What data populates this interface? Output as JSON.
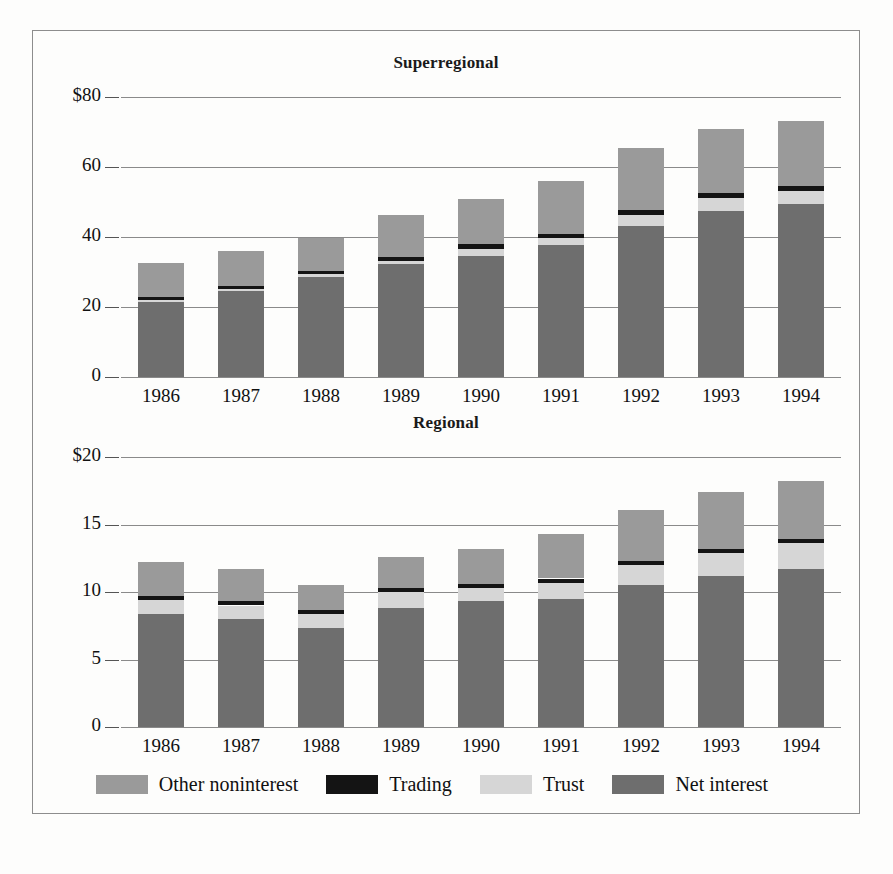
{
  "figure": {
    "background": "#fdfdfc",
    "frame_color": "#8d8d8d"
  },
  "colors": {
    "other_noninterest": "#9a9a9a",
    "trading": "#141414",
    "trust": "#d6d6d6",
    "net_interest": "#6e6e6e",
    "gridline": "#8a8a8a",
    "text": "#111111"
  },
  "legend": {
    "position": "bottom",
    "items": [
      {
        "label": "Other noninterest",
        "color_key": "other_noninterest",
        "swatch": "#9a9a9a"
      },
      {
        "label": "Trading",
        "color_key": "trading",
        "swatch": "#141414"
      },
      {
        "label": "Trust",
        "color_key": "trust",
        "swatch": "#d6d6d6"
      },
      {
        "label": "Net interest",
        "color_key": "net_interest",
        "swatch": "#6e6e6e"
      }
    ]
  },
  "chart_data": [
    {
      "type": "bar",
      "stacked": true,
      "title": "Superregional",
      "xlabel": "",
      "ylabel": "",
      "ylim": [
        0,
        80
      ],
      "yticks": [
        0,
        20,
        40,
        60,
        80
      ],
      "ytick_labels": [
        "0",
        "20",
        "40",
        "60",
        "$80"
      ],
      "grid": true,
      "categories": [
        "1986",
        "1987",
        "1988",
        "1989",
        "1990",
        "1991",
        "1992",
        "1993",
        "1994"
      ],
      "series": [
        {
          "name": "Net interest",
          "values": [
            21.5,
            24.5,
            28.6,
            32.3,
            34.6,
            37.6,
            43.2,
            47.4,
            49.3
          ]
        },
        {
          "name": "Trust",
          "values": [
            0.5,
            0.6,
            0.7,
            0.9,
            2.1,
            2.0,
            3.1,
            3.8,
            3.9
          ]
        },
        {
          "name": "Trading",
          "values": [
            0.9,
            1.0,
            1.0,
            1.1,
            1.2,
            1.3,
            1.3,
            1.3,
            1.4
          ]
        },
        {
          "name": "Other noninterest",
          "values": [
            9.6,
            10.0,
            9.3,
            12.0,
            13.0,
            15.1,
            17.7,
            18.5,
            18.5
          ]
        }
      ],
      "totals": [
        32.5,
        36.1,
        39.6,
        46.3,
        50.9,
        56.0,
        65.3,
        71.0,
        73.1
      ]
    },
    {
      "type": "bar",
      "stacked": true,
      "title": "Regional",
      "xlabel": "",
      "ylabel": "",
      "ylim": [
        0,
        20
      ],
      "yticks": [
        0,
        5,
        10,
        15,
        20
      ],
      "ytick_labels": [
        "0",
        "5",
        "10",
        "15",
        "$20"
      ],
      "grid": true,
      "categories": [
        "1986",
        "1987",
        "1988",
        "1989",
        "1990",
        "1991",
        "1992",
        "1993",
        "1994"
      ],
      "series": [
        {
          "name": "Net interest",
          "values": [
            8.4,
            8.0,
            7.3,
            8.8,
            9.3,
            9.5,
            10.5,
            11.2,
            11.7
          ]
        },
        {
          "name": "Trust",
          "values": [
            1.0,
            1.0,
            1.1,
            1.2,
            1.0,
            1.2,
            1.5,
            1.7,
            1.9
          ]
        },
        {
          "name": "Trading",
          "values": [
            0.3,
            0.3,
            0.3,
            0.3,
            0.3,
            0.3,
            0.3,
            0.3,
            0.3
          ]
        },
        {
          "name": "Other noninterest",
          "values": [
            2.5,
            2.4,
            1.8,
            2.3,
            2.6,
            3.3,
            3.8,
            4.2,
            4.3
          ]
        }
      ],
      "totals": [
        12.2,
        11.7,
        10.5,
        12.6,
        13.2,
        14.3,
        16.1,
        17.4,
        18.2
      ]
    }
  ]
}
